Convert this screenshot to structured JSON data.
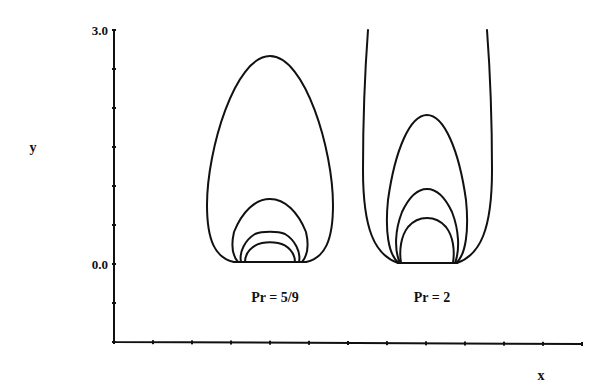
{
  "chart_data": {
    "type": "line",
    "title": "",
    "xlabel": "x",
    "ylabel": "y",
    "ylim": [
      -1.0,
      3.0
    ],
    "y_tick_labels": [
      "3.0",
      "0.0"
    ],
    "y_tick_step": 0.5,
    "x_tick_count": 13,
    "panels": [
      {
        "label": "Pr = 5/9",
        "curves": [
          {
            "name": "contour-1",
            "peak_y": 2.65,
            "open": false
          },
          {
            "name": "contour-2",
            "peak_y": 0.83,
            "open": false
          },
          {
            "name": "contour-3",
            "peak_y": 0.41,
            "open": false
          },
          {
            "name": "contour-4",
            "peak_y": 0.27,
            "open": false
          }
        ]
      },
      {
        "label": "Pr = 2",
        "curves": [
          {
            "name": "contour-open",
            "peak_y": 3.0,
            "open": true
          },
          {
            "name": "contour-2",
            "peak_y": 1.91,
            "open": false
          },
          {
            "name": "contour-3",
            "peak_y": 0.96,
            "open": false
          },
          {
            "name": "contour-4",
            "peak_y": 0.59,
            "open": false
          }
        ]
      }
    ]
  }
}
